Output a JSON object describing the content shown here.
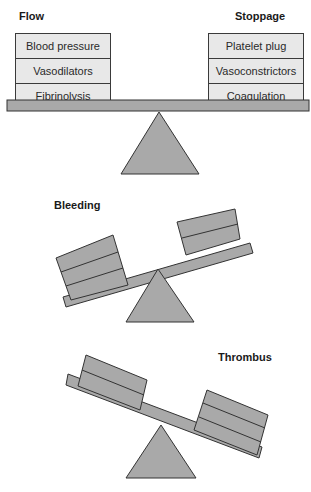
{
  "balanced": {
    "left_title": "Flow",
    "right_title": "Stoppage",
    "left_items": [
      "Blood pressure",
      "Vasodilators",
      "Fibrinolysis"
    ],
    "right_items": [
      "Platelet plug",
      "Vasoconstrictors",
      "Coagulation"
    ]
  },
  "bleeding": {
    "title": "Bleeding"
  },
  "thrombus": {
    "title": "Thrombus"
  },
  "colors": {
    "fill": "#a9a9a9",
    "stroke": "#333333",
    "box_fill": "#e8e8e8"
  }
}
